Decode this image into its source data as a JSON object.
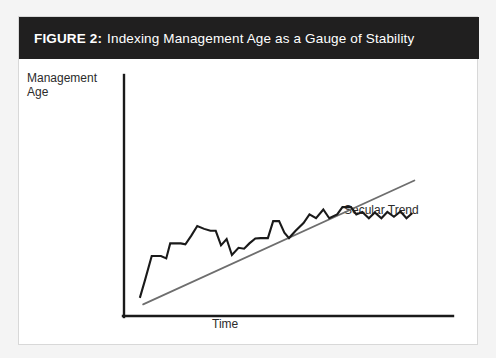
{
  "figure": {
    "number_label": "FIGURE 2:",
    "title": "Indexing Management Age as a Gauge of Stability",
    "banner_color": "#201f1f",
    "banner_text_color": "#ffffff",
    "card_background": "#ffffff",
    "page_background": "#f4f4f4"
  },
  "labels": {
    "y_axis": "Management\nAge",
    "y_axis_line1": "Management",
    "y_axis_line2": "Age",
    "x_axis": "Time",
    "trend_annotation": "Secular Trend"
  },
  "chart_data": {
    "type": "line",
    "title": "Indexing Management Age as a Gauge of Stability",
    "xlabel": "Time",
    "ylabel": "Management Age",
    "grid": false,
    "legend": false,
    "annotations": [
      {
        "text": "Secular Trend",
        "x": 0.7,
        "y": 0.62,
        "target_series": "secular-trend"
      }
    ],
    "axis": {
      "x_range": [
        0,
        1
      ],
      "y_range": [
        0,
        1
      ],
      "ticks_shown": false,
      "axis_color": "#1a1a1a"
    },
    "series": [
      {
        "name": "Management Age (observed)",
        "id": "management-age-series",
        "color": "#1a1a1a",
        "width": 2.1,
        "style": "solid",
        "points": [
          [
            0.048,
            0.075
          ],
          [
            0.063,
            0.145
          ],
          [
            0.084,
            0.248
          ],
          [
            0.112,
            0.248
          ],
          [
            0.128,
            0.238
          ],
          [
            0.14,
            0.3
          ],
          [
            0.172,
            0.3
          ],
          [
            0.186,
            0.296
          ],
          [
            0.204,
            0.332
          ],
          [
            0.222,
            0.372
          ],
          [
            0.243,
            0.36
          ],
          [
            0.262,
            0.352
          ],
          [
            0.278,
            0.352
          ],
          [
            0.294,
            0.292
          ],
          [
            0.311,
            0.318
          ],
          [
            0.327,
            0.252
          ],
          [
            0.347,
            0.282
          ],
          [
            0.364,
            0.278
          ],
          [
            0.38,
            0.3
          ],
          [
            0.398,
            0.32
          ],
          [
            0.414,
            0.322
          ],
          [
            0.436,
            0.322
          ],
          [
            0.452,
            0.392
          ],
          [
            0.47,
            0.392
          ],
          [
            0.486,
            0.344
          ],
          [
            0.5,
            0.322
          ],
          [
            0.52,
            0.352
          ],
          [
            0.544,
            0.384
          ],
          [
            0.562,
            0.42
          ],
          [
            0.582,
            0.404
          ],
          [
            0.604,
            0.44
          ],
          [
            0.622,
            0.404
          ],
          [
            0.646,
            0.42
          ],
          [
            0.662,
            0.45
          ],
          [
            0.688,
            0.45
          ],
          [
            0.704,
            0.42
          ],
          [
            0.722,
            0.43
          ],
          [
            0.742,
            0.404
          ],
          [
            0.76,
            0.428
          ],
          [
            0.78,
            0.404
          ],
          [
            0.798,
            0.43
          ],
          [
            0.818,
            0.41
          ],
          [
            0.838,
            0.432
          ],
          [
            0.856,
            0.404
          ],
          [
            0.874,
            0.426
          ]
        ]
      },
      {
        "name": "Secular Trend",
        "id": "secular-trend",
        "color": "#6e6e6e",
        "width": 1.8,
        "style": "solid",
        "points": [
          [
            0.058,
            0.048
          ],
          [
            0.88,
            0.56
          ]
        ]
      }
    ]
  }
}
